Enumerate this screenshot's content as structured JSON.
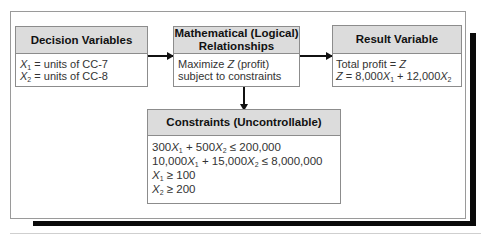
{
  "diagram": {
    "decision_box": {
      "title": "Decision Variables",
      "lines": [
        {
          "var": "X",
          "sub": "1",
          "text": " = units of CC-7"
        },
        {
          "var": "X",
          "sub": "2",
          "text": " = units of CC-8"
        }
      ]
    },
    "math_box": {
      "title_line1": "Mathematical (Logical)",
      "title_line2": "Relationships",
      "line1_pre": "Maximize ",
      "line1_var": "Z",
      "line1_post": " (profit)",
      "line2": "subject to constraints"
    },
    "result_box": {
      "title": "Result Variable",
      "line1_pre": "Total profit = ",
      "line1_var": "Z",
      "line2_var": "Z",
      "line2_a": " = 8,000",
      "line2_x1": "X",
      "line2_s1": "1",
      "line2_b": " + 12,000",
      "line2_x2": "X",
      "line2_s2": "2"
    },
    "constraints_box": {
      "title": "Constraints (Uncontrollable)",
      "c1": {
        "a": "300",
        "x1": "X",
        "s1": "1",
        "b": " + 500",
        "x2": "X",
        "s2": "2",
        "c": " ≤ 200,000"
      },
      "c2": {
        "a": "10,000",
        "x1": "X",
        "s1": "1",
        "b": " + 15,000",
        "x2": "X",
        "s2": "2",
        "c": " ≤ 8,000,000"
      },
      "c3": {
        "x": "X",
        "s": "1",
        "c": " ≥ 100"
      },
      "c4": {
        "x": "X",
        "s": "2",
        "c": " ≥ 200"
      }
    },
    "edges": [
      {
        "from": "Decision Variables",
        "to": "Mathematical (Logical) Relationships"
      },
      {
        "from": "Mathematical (Logical) Relationships",
        "to": "Result Variable"
      },
      {
        "from": "Mathematical (Logical) Relationships",
        "to": "Constraints (Uncontrollable)"
      }
    ]
  }
}
